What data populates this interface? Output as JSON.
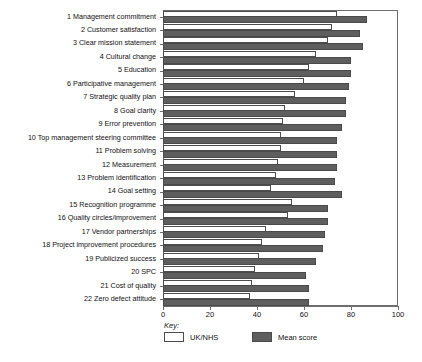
{
  "chart_data": {
    "type": "bar",
    "orientation": "horizontal",
    "title": "",
    "xlabel": "",
    "ylabel": "",
    "xlim": [
      0,
      100
    ],
    "xticks": [
      0,
      20,
      40,
      60,
      80,
      100
    ],
    "grid": false,
    "legend_position": "bottom-left",
    "legend_title": "Key:",
    "categories": [
      "1 Management commitment",
      "2 Customer satisfaction",
      "3 Clear mission statement",
      "4 Cultural change",
      "5 Education",
      "6 Participative management",
      "7 Strategic quality plan",
      "8 Goal clarity",
      "9 Error prevention",
      "10 Top management steering committee",
      "11 Problem solving",
      "12 Measurement",
      "13 Problem identification",
      "14 Goal setting",
      "15 Recognition programme",
      "16 Quality circles/improvement",
      "17 Vendor partnerships",
      "18 Project improvement procedures",
      "19 Publicized success",
      "20 SPC",
      "21 Cost of quality",
      "22 Zero defect attitude"
    ],
    "series": [
      {
        "name": "UK/NHS",
        "color": "#ffffff",
        "values": [
          74,
          72,
          70,
          65,
          62,
          60,
          56,
          52,
          51,
          50,
          50,
          49,
          48,
          46,
          55,
          53,
          44,
          42,
          41,
          39,
          38,
          37
        ]
      },
      {
        "name": "Mean score",
        "color": "#5e5e5e",
        "values": [
          87,
          84,
          85,
          80,
          80,
          79,
          78,
          78,
          76,
          74,
          74,
          74,
          73,
          76,
          70,
          70,
          69,
          68,
          65,
          61,
          62,
          62
        ]
      }
    ]
  }
}
